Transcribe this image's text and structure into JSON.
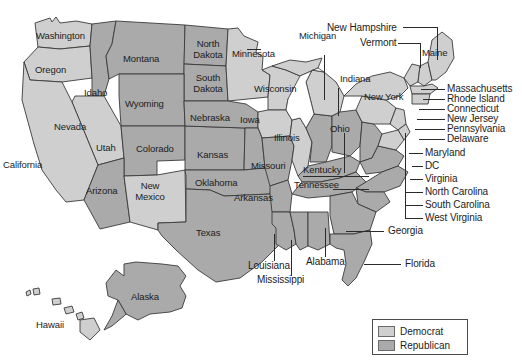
{
  "map": {
    "title": "United States Presidential Election Results by State",
    "colors": {
      "democrat": "#cfcfcf",
      "republican": "#aaaaaa",
      "border": "#3a3a3a",
      "background": "#ffffff",
      "text": "#1c1c1c",
      "leader_line": "#2a2a2a"
    },
    "inline_labels": [
      {
        "name": "Washington",
        "text": "Washington",
        "x": 36,
        "y": 31,
        "party": "democrat"
      },
      {
        "name": "Oregon",
        "text": "Oregon",
        "x": 35,
        "y": 65,
        "party": "democrat"
      },
      {
        "name": "Idaho",
        "text": "Idaho",
        "x": 84,
        "y": 88,
        "party": "republican"
      },
      {
        "name": "Montana",
        "text": "Montana",
        "x": 123,
        "y": 54,
        "party": "republican"
      },
      {
        "name": "North Dakota",
        "text": "North Dakota",
        "x": 189,
        "y": 45,
        "party": "republican"
      },
      {
        "name": "South Dakota",
        "text": "South Dakota",
        "x": 189,
        "y": 79,
        "party": "republican"
      },
      {
        "name": "Minnesota",
        "text": "Minnesota",
        "x": 232,
        "y": 55,
        "party": "democrat"
      },
      {
        "name": "Wisconsin",
        "text": "Wisconsin",
        "x": 256,
        "y": 84,
        "party": "democrat"
      },
      {
        "name": "Wyoming",
        "text": "Wyoming",
        "x": 125,
        "y": 101,
        "party": "republican"
      },
      {
        "name": "Nevada",
        "text": "Nevada",
        "x": 54,
        "y": 122,
        "party": "democrat"
      },
      {
        "name": "Utah",
        "text": "Utah",
        "x": 96,
        "y": 145,
        "party": "republican"
      },
      {
        "name": "Colorado",
        "text": "Colorado",
        "x": 136,
        "y": 146,
        "party": "republican"
      },
      {
        "name": "Nebraska",
        "text": "Nebraska",
        "x": 190,
        "y": 116,
        "party": "republican"
      },
      {
        "name": "Iowa",
        "text": "Iowa",
        "x": 240,
        "y": 115,
        "party": "democrat"
      },
      {
        "name": "Illinois",
        "text": "Illinois",
        "x": 276,
        "y": 134,
        "party": "democrat"
      },
      {
        "name": "Ohio",
        "text": "Ohio",
        "x": 330,
        "y": 125,
        "party": "republican"
      },
      {
        "name": "Kansas",
        "text": "Kansas",
        "x": 197,
        "y": 152,
        "party": "republican"
      },
      {
        "name": "Missouri",
        "text": "Missouri",
        "x": 252,
        "y": 163,
        "party": "republican"
      },
      {
        "name": "Kentucky",
        "text": "Kentucky",
        "x": 304,
        "y": 167,
        "party": "republican"
      },
      {
        "name": "California",
        "text": "California",
        "x": 5,
        "y": 160,
        "party": "democrat"
      },
      {
        "name": "Arizona",
        "text": "Arizona",
        "x": 86,
        "y": 186,
        "party": "republican"
      },
      {
        "name": "New Mexico",
        "text": "New Mexico",
        "x": 134,
        "y": 184,
        "party": "democrat"
      },
      {
        "name": "Oklahoma",
        "text": "Oklahoma",
        "x": 196,
        "y": 180,
        "party": "republican"
      },
      {
        "name": "Arkansas",
        "text": "Arkansas",
        "x": 235,
        "y": 195,
        "party": "republican"
      },
      {
        "name": "Tennessee",
        "text": "Tennessee",
        "x": 296,
        "y": 182,
        "party": "republican"
      },
      {
        "name": "Texas",
        "text": "Texas",
        "x": 196,
        "y": 229,
        "party": "republican"
      },
      {
        "name": "Michigan",
        "text": "Michigan",
        "x": 301,
        "y": 43,
        "party": "democrat"
      },
      {
        "name": "Indiana",
        "text": "Indiana",
        "x": 342,
        "y": 76,
        "party": "republican"
      },
      {
        "name": "New York",
        "text": "New York",
        "x": 366,
        "y": 94,
        "party": "democrat"
      },
      {
        "name": "Maine",
        "text": "Maine",
        "x": 424,
        "y": 51,
        "party": "democrat"
      },
      {
        "name": "Alaska",
        "text": "Alaska",
        "x": 132,
        "y": 296,
        "party": "republican"
      },
      {
        "name": "Hawaii",
        "text": "Hawaii",
        "x": 37,
        "y": 322,
        "party": "democrat"
      }
    ],
    "callout_labels": [
      {
        "name": "New Hampshire",
        "text": "New Hampshire",
        "x": 327,
        "y": 24,
        "party": "democrat"
      },
      {
        "name": "Vermont",
        "text": "Vermont",
        "x": 360,
        "y": 40,
        "party": "democrat"
      },
      {
        "name": "Massachusetts",
        "text": "Massachusetts",
        "x": 447,
        "y": 86,
        "party": "democrat"
      },
      {
        "name": "Rhode Island",
        "text": "Rhode Island",
        "x": 447,
        "y": 96,
        "party": "democrat"
      },
      {
        "name": "Connecticut",
        "text": "Connecticut",
        "x": 447,
        "y": 106,
        "party": "democrat"
      },
      {
        "name": "New Jersey",
        "text": "New Jersey",
        "x": 447,
        "y": 116,
        "party": "democrat"
      },
      {
        "name": "Pennsylvania",
        "text": "Pennsylvania",
        "x": 447,
        "y": 126,
        "party": "democrat"
      },
      {
        "name": "Delaware",
        "text": "Delaware",
        "x": 447,
        "y": 136,
        "party": "democrat"
      },
      {
        "name": "Maryland",
        "text": "Maryland",
        "x": 425,
        "y": 150,
        "party": "democrat"
      },
      {
        "name": "DC",
        "text": "DC",
        "x": 425,
        "y": 163,
        "party": "democrat"
      },
      {
        "name": "Virginia",
        "text": "Virginia",
        "x": 425,
        "y": 176,
        "party": "republican"
      },
      {
        "name": "North Carolina",
        "text": "North Carolina",
        "x": 425,
        "y": 189,
        "party": "republican"
      },
      {
        "name": "South Carolina",
        "text": "South Carolina",
        "x": 425,
        "y": 202,
        "party": "republican"
      },
      {
        "name": "West Virginia",
        "text": "West Virginia",
        "x": 425,
        "y": 215,
        "party": "republican"
      },
      {
        "name": "Georgia",
        "text": "Georgia",
        "x": 388,
        "y": 228,
        "party": "republican"
      },
      {
        "name": "Florida",
        "text": "Florida",
        "x": 405,
        "y": 261,
        "party": "republican"
      },
      {
        "name": "Louisiana",
        "text": "Louisiana",
        "x": 249,
        "y": 263,
        "party": "republican"
      },
      {
        "name": "Mississippi",
        "text": "Mississippi",
        "x": 258,
        "y": 277,
        "party": "republican"
      },
      {
        "name": "Alabama",
        "text": "Alabama",
        "x": 307,
        "y": 259,
        "party": "republican"
      }
    ],
    "leader_lines": [
      {
        "name": "leader-new-hampshire-h",
        "orient": "h",
        "x": 403,
        "y": 27,
        "len": 34
      },
      {
        "name": "leader-new-hampshire-v",
        "orient": "v",
        "x": 437,
        "y": 27,
        "len": 33
      },
      {
        "name": "leader-vermont-h",
        "orient": "h",
        "x": 398,
        "y": 43,
        "len": 22
      },
      {
        "name": "leader-vermont-v",
        "orient": "v",
        "x": 420,
        "y": 43,
        "len": 25
      },
      {
        "name": "leader-massachusetts",
        "orient": "h",
        "x": 421,
        "y": 89,
        "len": 24
      },
      {
        "name": "leader-rhode-island",
        "orient": "h",
        "x": 423,
        "y": 99,
        "len": 22
      },
      {
        "name": "leader-connecticut",
        "orient": "h",
        "x": 419,
        "y": 109,
        "len": 26
      },
      {
        "name": "leader-new-jersey",
        "orient": "h",
        "x": 417,
        "y": 119,
        "len": 28
      },
      {
        "name": "leader-pennsylvania",
        "orient": "h",
        "x": 415,
        "y": 129,
        "len": 30
      },
      {
        "name": "leader-delaware",
        "orient": "h",
        "x": 419,
        "y": 139,
        "len": 26
      },
      {
        "name": "leader-maryland",
        "orient": "h",
        "x": 409,
        "y": 153,
        "len": 14
      },
      {
        "name": "leader-dc",
        "orient": "h",
        "x": 412,
        "y": 166,
        "len": 11
      },
      {
        "name": "leader-virginia",
        "orient": "h",
        "x": 410,
        "y": 179,
        "len": 13
      },
      {
        "name": "leader-north-carolina",
        "orient": "h",
        "x": 405,
        "y": 192,
        "len": 18
      },
      {
        "name": "leader-south-carolina",
        "orient": "h",
        "x": 405,
        "y": 205,
        "len": 18
      },
      {
        "name": "leader-west-virginia",
        "orient": "h",
        "x": 405,
        "y": 218,
        "len": 18
      },
      {
        "name": "leader-west-virginia-v",
        "orient": "v",
        "x": 405,
        "y": 133,
        "len": 85
      },
      {
        "name": "leader-georgia",
        "orient": "h",
        "x": 346,
        "y": 231,
        "len": 38
      },
      {
        "name": "leader-florida",
        "orient": "h",
        "x": 364,
        "y": 264,
        "len": 37
      },
      {
        "name": "leader-louisiana",
        "orient": "v",
        "x": 274,
        "y": 234,
        "len": 27
      },
      {
        "name": "leader-mississippi",
        "orient": "v",
        "x": 291,
        "y": 240,
        "len": 36
      },
      {
        "name": "leader-alabama",
        "orient": "v",
        "x": 325,
        "y": 228,
        "len": 29
      },
      {
        "name": "leader-michigan",
        "orient": "v",
        "x": 324,
        "y": 55,
        "len": 45
      },
      {
        "name": "leader-indiana",
        "orient": "v",
        "x": 338,
        "y": 88,
        "len": 28
      },
      {
        "name": "leader-minnesota",
        "orient": "h",
        "x": 247,
        "y": 49,
        "len": 14
      },
      {
        "name": "leader-kentucky-h",
        "orient": "h",
        "x": 303,
        "y": 176,
        "len": 66
      },
      {
        "name": "leader-tennessee-h",
        "orient": "h",
        "x": 333,
        "y": 189,
        "len": 36
      },
      {
        "name": "leader-ohio-v",
        "orient": "v",
        "x": 344,
        "y": 133,
        "len": 40
      }
    ]
  },
  "legend": {
    "name": "map-legend",
    "items": [
      {
        "label": "Democrat",
        "party": "dem",
        "color": "#cfcfcf"
      },
      {
        "label": "Republican",
        "party": "rep",
        "color": "#aaaaaa"
      }
    ]
  }
}
